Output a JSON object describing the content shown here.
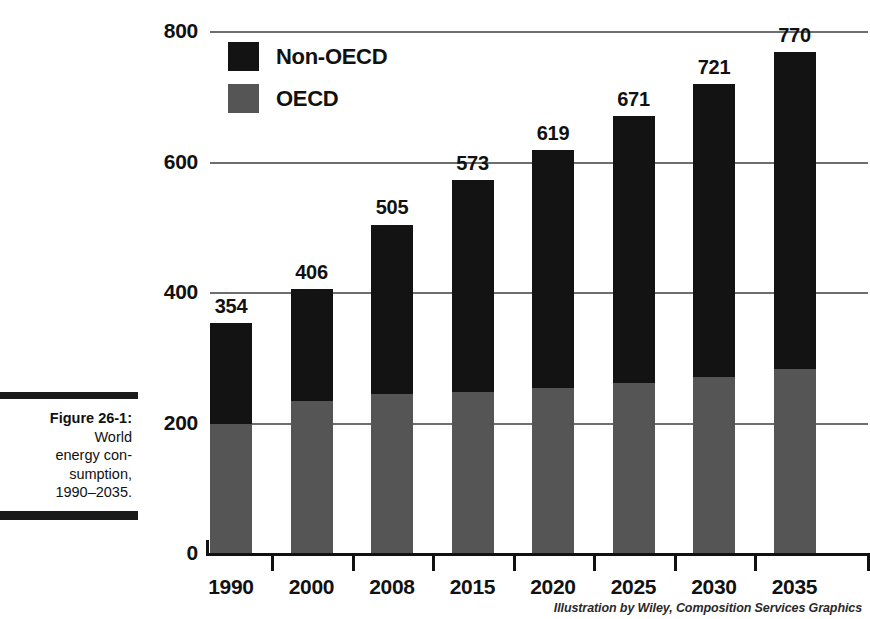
{
  "caption": {
    "label": "Figure 26-1:",
    "lines": [
      "World",
      "energy con-",
      "sumption,",
      "1990–2035."
    ]
  },
  "attribution": "Illustration by Wiley, Composition Services Graphics",
  "legend": {
    "position": "top-left-inside",
    "items": [
      {
        "name": "Non-OECD",
        "color": "#131313"
      },
      {
        "name": "OECD",
        "color": "#555555"
      }
    ]
  },
  "chart_data": {
    "type": "bar",
    "stacked": true,
    "title": "",
    "subtitle": "",
    "xlabel": "",
    "ylabel": "",
    "categories": [
      "1990",
      "2000",
      "2008",
      "2015",
      "2020",
      "2025",
      "2030",
      "2035"
    ],
    "series": [
      {
        "name": "OECD",
        "color": "#555555",
        "values": [
          200,
          235,
          245,
          248,
          255,
          262,
          272,
          283
        ]
      },
      {
        "name": "Non-OECD",
        "color": "#131313",
        "values": [
          154,
          171,
          260,
          325,
          364,
          409,
          449,
          487
        ]
      }
    ],
    "totals": [
      354,
      406,
      505,
      573,
      619,
      671,
      721,
      770
    ],
    "data_labels": [
      "354",
      "406",
      "505",
      "573",
      "619",
      "671",
      "721",
      "770"
    ],
    "ylim": [
      0,
      800
    ],
    "yticks": [
      0,
      200,
      400,
      600,
      800
    ],
    "ytick_labels": [
      "0",
      "200",
      "400",
      "600",
      "800"
    ],
    "grid": true,
    "grid_axis": "y",
    "legend_position": "top-left"
  }
}
